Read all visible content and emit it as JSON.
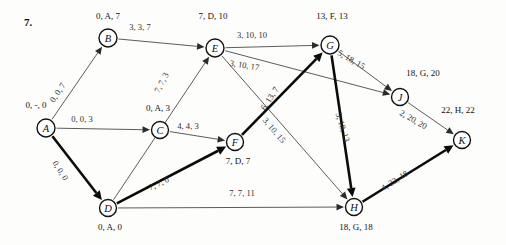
{
  "problem": {
    "number": "7."
  },
  "graph": {
    "nodes": [
      {
        "id": "A",
        "letter": "A",
        "label": "0, -, 0",
        "cx": 46,
        "cy": 128,
        "r": 9,
        "label_x": 36,
        "label_y": 108
      },
      {
        "id": "B",
        "letter": "B",
        "label": "0, A, 7",
        "cx": 108,
        "cy": 38,
        "r": 9,
        "label_x": 108,
        "label_y": 19
      },
      {
        "id": "C",
        "letter": "C",
        "label": "0, A, 3",
        "cx": 160,
        "cy": 130,
        "r": 8.5,
        "label_x": 158,
        "label_y": 111
      },
      {
        "id": "D",
        "letter": "D",
        "label": "0, A, 0",
        "cx": 108,
        "cy": 208,
        "r": 8.5,
        "label_x": 110,
        "label_y": 230
      },
      {
        "id": "E",
        "letter": "E",
        "label": "7, D, 10",
        "cx": 215,
        "cy": 48,
        "r": 9,
        "label_x": 213,
        "label_y": 19
      },
      {
        "id": "F",
        "letter": "F",
        "label": "7, D, 7",
        "cx": 235,
        "cy": 142,
        "r": 8.5,
        "label_x": 238,
        "label_y": 164
      },
      {
        "id": "G",
        "letter": "G",
        "label": "13, F, 13",
        "cx": 330,
        "cy": 45,
        "r": 9,
        "label_x": 332,
        "label_y": 19
      },
      {
        "id": "H",
        "letter": "H",
        "label": "18, G, 18",
        "cx": 354,
        "cy": 207,
        "r": 8.5,
        "label_x": 356,
        "label_y": 230
      },
      {
        "id": "J",
        "letter": "J",
        "label": "18, G, 20",
        "cx": 400,
        "cy": 97,
        "r": 8.5,
        "label_x": 423,
        "label_y": 76
      },
      {
        "id": "K",
        "letter": "K",
        "label": "22, H, 22",
        "cx": 462,
        "cy": 140,
        "r": 8.5,
        "label_x": 458,
        "label_y": 113
      }
    ],
    "edges": [
      {
        "id": "A-B",
        "from": "A",
        "to": "B",
        "label": "0, 0, 7",
        "bold": false,
        "label_x": 60,
        "label_y": 94,
        "rotate": -56
      },
      {
        "id": "A-C",
        "from": "A",
        "to": "C",
        "label": "0, 0, 3",
        "bold": false,
        "label_x": 82,
        "label_y": 122,
        "rotate": 0
      },
      {
        "id": "A-D",
        "from": "A",
        "to": "D",
        "label": "0, 0, 0",
        "bold": true,
        "label_x": 58,
        "label_y": 172,
        "rotate": 58
      },
      {
        "id": "B-E",
        "from": "B",
        "to": "E",
        "label": "3, 3, 7",
        "bold": false,
        "label_x": 140,
        "label_y": 30,
        "rotate": 0
      },
      {
        "id": "C-F",
        "from": "C",
        "to": "F",
        "label": "4, 4, 3",
        "bold": false,
        "label_x": 188,
        "label_y": 129,
        "rotate": 0
      },
      {
        "id": "D-E",
        "from": "D",
        "to": "E",
        "label": "7, 7, 3",
        "bold": false,
        "label_x": 164,
        "label_y": 84,
        "rotate": -62
      },
      {
        "id": "D-F",
        "from": "D",
        "to": "F",
        "label": "7, 7, 0",
        "bold": true,
        "label_x": 160,
        "label_y": 186,
        "rotate": -25
      },
      {
        "id": "D-H",
        "from": "D",
        "to": "H",
        "label": "7, 7, 11",
        "bold": false,
        "label_x": 242,
        "label_y": 196,
        "rotate": 0
      },
      {
        "id": "E-G",
        "from": "E",
        "to": "G",
        "label": "3, 10, 10",
        "bold": false,
        "label_x": 252,
        "label_y": 38,
        "rotate": 0
      },
      {
        "id": "E-J",
        "from": "E",
        "to": "J",
        "label": "3, 10, 17",
        "bold": false,
        "label_x": 244,
        "label_y": 68,
        "rotate": 9
      },
      {
        "id": "E-H",
        "from": "E",
        "to": "H",
        "label": "3, 10, 15",
        "bold": false,
        "label_x": 272,
        "label_y": 132,
        "rotate": 50
      },
      {
        "id": "F-G",
        "from": "F",
        "to": "G",
        "label": "6, 13, 7",
        "bold": true,
        "label_x": 272,
        "label_y": 100,
        "rotate": -57
      },
      {
        "id": "G-J",
        "from": "G",
        "to": "J",
        "label": "5, 18, 15",
        "bold": false,
        "label_x": 350,
        "label_y": 62,
        "rotate": 30
      },
      {
        "id": "G-H",
        "from": "G",
        "to": "H",
        "label": "5, 18, 13",
        "bold": true,
        "label_x": 340,
        "label_y": 128,
        "rotate": 73
      },
      {
        "id": "J-K",
        "from": "J",
        "to": "K",
        "label": "2, 20, 20",
        "bold": false,
        "label_x": 412,
        "label_y": 122,
        "rotate": 30
      },
      {
        "id": "H-K",
        "from": "H",
        "to": "K",
        "label": "4, 22, 18",
        "bold": true,
        "label_x": 396,
        "label_y": 183,
        "rotate": -32
      }
    ]
  }
}
